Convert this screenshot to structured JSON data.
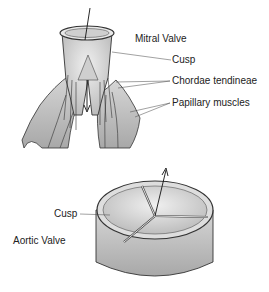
{
  "diagram": {
    "mitral": {
      "title": "Mitral Valve",
      "labels": [
        "Cusp",
        "Chordae tendineae",
        "Papillary muscles"
      ]
    },
    "aortic": {
      "title": "Aortic Valve",
      "labels": [
        "Cusp"
      ]
    }
  },
  "colors": {
    "ink": "#222222",
    "shade": "#bdbdbd",
    "light": "#e3e3e3",
    "background": "#ffffff"
  }
}
